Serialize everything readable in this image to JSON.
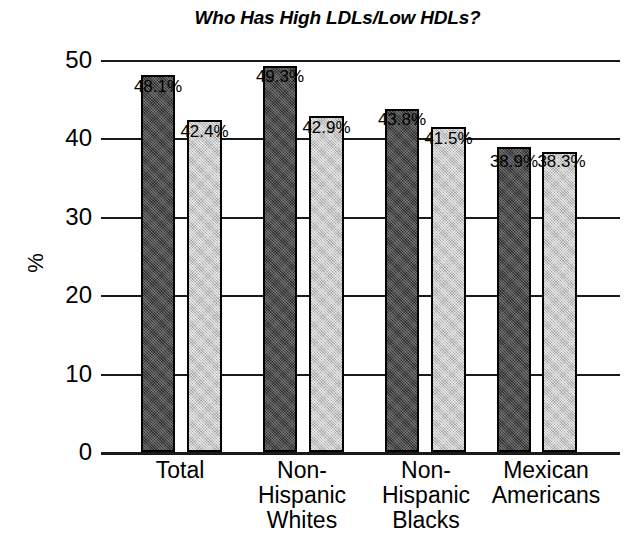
{
  "chart_data": {
    "type": "bar",
    "title": "Who Has High LDLs/Low HDLs?",
    "xlabel": "",
    "ylabel": "%",
    "ylim": [
      0,
      50
    ],
    "yticks": [
      0,
      10,
      20,
      30,
      40,
      50
    ],
    "ytick_labels": [
      "0",
      "10",
      "20",
      "30",
      "40",
      "50"
    ],
    "grid": true,
    "legend": "none",
    "categories": [
      "Total",
      "Non-Hispanic Whites",
      "Non-Hispanic Blacks",
      "Mexican Americans"
    ],
    "category_lines": [
      [
        "Total"
      ],
      [
        "Non-",
        "Hispanic",
        "Whites"
      ],
      [
        "Non-",
        "Hispanic",
        "Blacks"
      ],
      [
        "Mexican",
        "Americans"
      ]
    ],
    "series": [
      {
        "name": "High LDL",
        "color": "#4a4a4a",
        "values": [
          48.1,
          49.3,
          43.8,
          38.9
        ],
        "labels": [
          "48.1%",
          "49.3%",
          "43.8%",
          "38.9%"
        ]
      },
      {
        "name": "Low HDL",
        "color": "#c9c9c9",
        "values": [
          42.4,
          42.9,
          41.5,
          38.3
        ],
        "labels": [
          "42.4%",
          "42.9%",
          "41.5%",
          "38.3%"
        ]
      }
    ]
  },
  "bars": [
    {
      "label": "48.1%",
      "value": 48.1,
      "tone": "dark",
      "x": 40,
      "w": 34,
      "label_x": 20,
      "label_y": 18
    },
    {
      "label": "42.4%",
      "value": 42.4,
      "tone": "light",
      "x": 86,
      "w": 35,
      "label_x": 66,
      "label_y": 63
    },
    {
      "label": "49.3%",
      "value": 49.3,
      "tone": "dark",
      "x": 162,
      "w": 34,
      "label_x": 142,
      "label_y": 8
    },
    {
      "label": "42.9%",
      "value": 42.9,
      "tone": "light",
      "x": 208,
      "w": 35,
      "label_x": 188,
      "label_y": 59
    },
    {
      "label": "43.8%",
      "value": 43.8,
      "tone": "dark",
      "x": 284,
      "w": 34,
      "label_x": 264,
      "label_y": 51
    },
    {
      "label": "41.5%",
      "value": 41.5,
      "tone": "light",
      "x": 330,
      "w": 35,
      "label_x": 310,
      "label_y": 70
    },
    {
      "label": "38.9%",
      "value": 38.9,
      "tone": "dark",
      "x": 396,
      "w": 34,
      "label_x": 376,
      "label_y": 93
    },
    {
      "label": "38.3%",
      "value": 38.3,
      "tone": "light",
      "x": 441,
      "w": 35,
      "label_x": 423,
      "label_y": 93
    }
  ],
  "category_positions": [
    {
      "left": 4,
      "width": 150
    },
    {
      "left": 126,
      "width": 150
    },
    {
      "left": 250,
      "width": 150
    },
    {
      "left": 365,
      "width": 160
    }
  ]
}
